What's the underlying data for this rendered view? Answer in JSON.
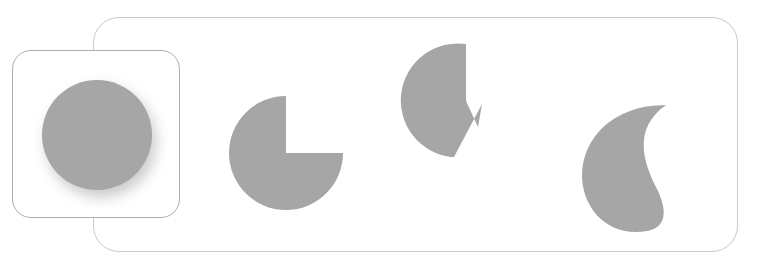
{
  "canvas": {
    "width": 774,
    "height": 262,
    "background": "#ffffff"
  },
  "theme": {
    "shape_fill": "#a6a6a6",
    "container_border": "#c9c9c9",
    "card_border": "#aeaeae",
    "card_background": "#ffffff",
    "shadow_color": "rgba(120,120,120,0.40)"
  },
  "selected_card": {
    "name": "full-circle-option",
    "label": "",
    "selected": true,
    "x": 12,
    "y": 50,
    "width": 168,
    "height": 168,
    "corner_radius": 19,
    "shape": {
      "type": "circle",
      "center_x": 84,
      "center_y": 84,
      "radius": 55,
      "missing_wedge_degrees": 0
    }
  },
  "options_container": {
    "x": 93,
    "y": 17,
    "width": 645,
    "height": 235,
    "corner_radius": 26
  },
  "options": [
    {
      "name": "option-circle",
      "index": 0,
      "label": "",
      "shape_type": "circle",
      "missing_wedge_degrees": 0,
      "center_x": 95,
      "center_y": 135,
      "radius": 55
    },
    {
      "name": "option-pacman-quarter",
      "index": 1,
      "label": "",
      "shape_type": "pacman",
      "missing_wedge_degrees": 90,
      "center_x": 285,
      "center_y": 152,
      "radius": 57
    },
    {
      "name": "option-pacman-notched-spike",
      "index": 2,
      "label": "",
      "shape_type": "notched-pacman",
      "missing_wedge_degrees": 120,
      "center_x": 455,
      "center_y": 100,
      "radius": 57
    },
    {
      "name": "option-crescent",
      "index": 3,
      "label": "",
      "shape_type": "crescent",
      "missing_wedge_degrees": 200,
      "center_x": 620,
      "center_y": 160,
      "radius": 55
    }
  ],
  "paths": {
    "circle": "M 84 29 A 55 55 0 1 1 83.9 29 Z",
    "pacman_quarter": "M 57 57 L 114 57 A 57 57 0 1 1 57 0 Z",
    "notched_pacman": "M 62 57 L 62 0 A 57 57 0 1 0 47 113 L 50 113 L 78 60 L 74 83 L 62 57 Z",
    "crescent": "M 86 4 C 52 28 64 62 76 86 C 90 114 86 131 56 131 C 22 131 2 103 2 74 C 2 40 30 4 86 4 Z"
  }
}
